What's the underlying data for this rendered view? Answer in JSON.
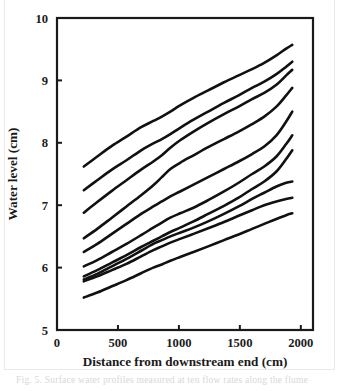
{
  "figure": {
    "caption_partial": "Fig. 5. Surface water profiles measured at ten flow rates along the flume"
  },
  "chart_data": {
    "type": "line",
    "title": "",
    "xlabel": "Distance from downstream end (cm)",
    "ylabel": "Water level (cm)",
    "xlim": [
      0,
      2100
    ],
    "ylim": [
      5,
      10
    ],
    "xticks": [
      0,
      500,
      1000,
      1500,
      2000
    ],
    "xtick_labels": [
      "0",
      "500",
      "1000",
      "1500",
      "2000"
    ],
    "yticks": [
      5,
      6,
      7,
      8,
      9,
      10
    ],
    "ytick_labels": [
      "5",
      "6",
      "7",
      "8",
      "9",
      "10"
    ],
    "grid": false,
    "legend": "none",
    "line_color": "#111111",
    "line_width": 2.6,
    "x": [
      220,
      330,
      450,
      570,
      690,
      790,
      860,
      930,
      1010,
      1120,
      1240,
      1370,
      1490,
      1600,
      1700,
      1800,
      1880,
      1930
    ],
    "series": [
      {
        "name": "profile-1",
        "values": [
          7.62,
          7.78,
          7.95,
          8.1,
          8.25,
          8.35,
          8.42,
          8.5,
          8.6,
          8.72,
          8.84,
          8.97,
          9.08,
          9.18,
          9.28,
          9.4,
          9.51,
          9.57
        ]
      },
      {
        "name": "profile-2",
        "values": [
          7.24,
          7.4,
          7.57,
          7.72,
          7.88,
          7.99,
          8.06,
          8.14,
          8.24,
          8.37,
          8.5,
          8.64,
          8.76,
          8.88,
          8.98,
          9.1,
          9.22,
          9.3
        ]
      },
      {
        "name": "profile-3",
        "values": [
          6.88,
          7.05,
          7.23,
          7.4,
          7.57,
          7.7,
          7.8,
          7.92,
          8.04,
          8.18,
          8.32,
          8.46,
          8.58,
          8.7,
          8.8,
          8.93,
          9.08,
          9.17
        ]
      },
      {
        "name": "profile-4",
        "values": [
          6.47,
          6.62,
          6.8,
          6.98,
          7.16,
          7.32,
          7.45,
          7.58,
          7.68,
          7.8,
          7.93,
          8.06,
          8.18,
          8.3,
          8.42,
          8.58,
          8.76,
          8.88
        ]
      },
      {
        "name": "profile-5",
        "values": [
          6.25,
          6.38,
          6.54,
          6.7,
          6.86,
          6.98,
          7.06,
          7.14,
          7.22,
          7.33,
          7.45,
          7.58,
          7.7,
          7.82,
          7.94,
          8.12,
          8.34,
          8.5
        ]
      },
      {
        "name": "profile-6",
        "values": [
          6.02,
          6.12,
          6.25,
          6.38,
          6.52,
          6.64,
          6.72,
          6.8,
          6.87,
          6.96,
          7.08,
          7.22,
          7.36,
          7.5,
          7.62,
          7.78,
          7.98,
          8.12
        ]
      },
      {
        "name": "profile-7",
        "values": [
          5.86,
          5.96,
          6.08,
          6.2,
          6.33,
          6.43,
          6.5,
          6.57,
          6.64,
          6.74,
          6.86,
          6.99,
          7.12,
          7.26,
          7.38,
          7.54,
          7.74,
          7.88
        ]
      },
      {
        "name": "profile-8",
        "values": [
          5.81,
          5.9,
          6.02,
          6.14,
          6.27,
          6.38,
          6.44,
          6.5,
          6.56,
          6.64,
          6.74,
          6.86,
          6.98,
          7.1,
          7.2,
          7.3,
          7.36,
          7.38
        ]
      },
      {
        "name": "profile-9",
        "values": [
          5.78,
          5.86,
          5.96,
          6.06,
          6.18,
          6.28,
          6.34,
          6.4,
          6.46,
          6.54,
          6.63,
          6.73,
          6.83,
          6.92,
          7.0,
          7.06,
          7.1,
          7.12
        ]
      },
      {
        "name": "profile-10",
        "values": [
          5.52,
          5.6,
          5.7,
          5.8,
          5.91,
          6.0,
          6.05,
          6.11,
          6.17,
          6.25,
          6.34,
          6.44,
          6.53,
          6.62,
          6.7,
          6.78,
          6.84,
          6.87
        ]
      }
    ]
  }
}
